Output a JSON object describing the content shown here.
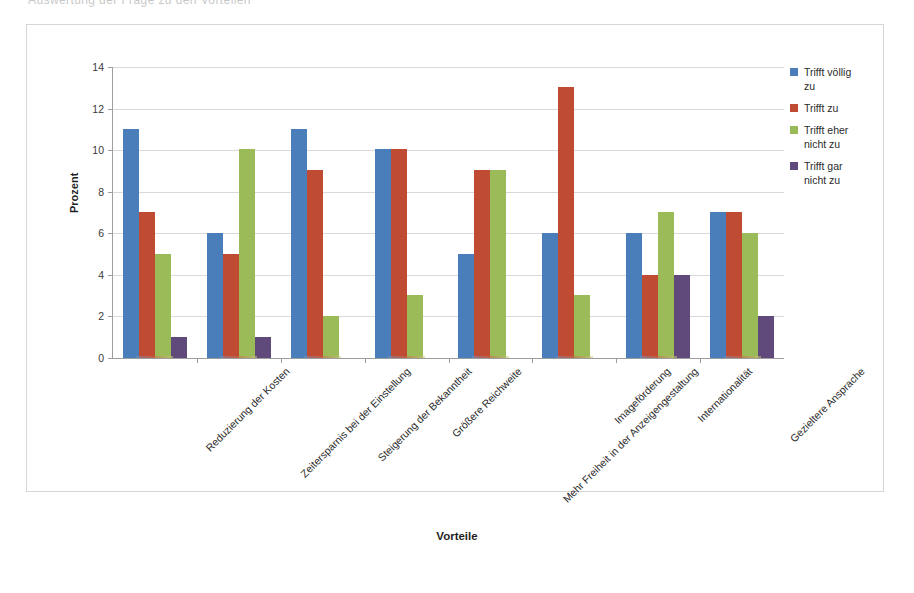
{
  "scan_artifact": {
    "top_sliver_text": "Auswertung der Frage zu den Vorteilen"
  },
  "axis_titles": {
    "y": "Prozent",
    "x": "Vorteile"
  },
  "legend": {
    "items": [
      {
        "label": "Trifft völlig\nzu",
        "color": "#4A7EBB",
        "swatch_name": "legend-swatch-trifft-voellig-zu"
      },
      {
        "label": "Trifft zu",
        "color": "#BE4B32",
        "swatch_name": "legend-swatch-trifft-zu"
      },
      {
        "label": "Trifft eher\nnicht zu",
        "color": "#9BBB59",
        "swatch_name": "legend-swatch-trifft-eher-nicht-zu"
      },
      {
        "label": "Trifft gar\nnicht zu",
        "color": "#604A7B",
        "swatch_name": "legend-swatch-trifft-gar-nicht-zu"
      }
    ]
  },
  "chart_data": {
    "type": "bar",
    "title": "",
    "xlabel": "Vorteile",
    "ylabel": "Prozent",
    "ylim": [
      0,
      14
    ],
    "ytick_step": 2,
    "yticks": [
      0,
      2,
      4,
      6,
      8,
      10,
      12,
      14
    ],
    "grid": true,
    "legend_position": "right",
    "categories": [
      "Reduzierung der Kosten",
      "Zeitersparnis bei der Einstellung",
      "Steigerung der Bekanntheit",
      "Größere Reichweite",
      "Mehr Freiheit in der Anzeigengestaltung",
      "Imageförderung",
      "Internationalität",
      "Gezieltere Ansprache"
    ],
    "series": [
      {
        "name": "Trifft völlig zu",
        "color": "#4A7EBB",
        "values": [
          11,
          6,
          11,
          10,
          5,
          6,
          6,
          7
        ]
      },
      {
        "name": "Trifft zu",
        "color": "#BE4B32",
        "values": [
          7,
          5,
          9,
          10,
          9,
          13,
          4,
          7
        ]
      },
      {
        "name": "Trifft eher nicht zu",
        "color": "#9BBB59",
        "values": [
          5,
          10,
          2,
          3,
          9,
          3,
          7,
          6
        ]
      },
      {
        "name": "Trifft gar nicht zu",
        "color": "#604A7B",
        "values": [
          1,
          1,
          0,
          0,
          0,
          0,
          4,
          2
        ]
      }
    ]
  }
}
